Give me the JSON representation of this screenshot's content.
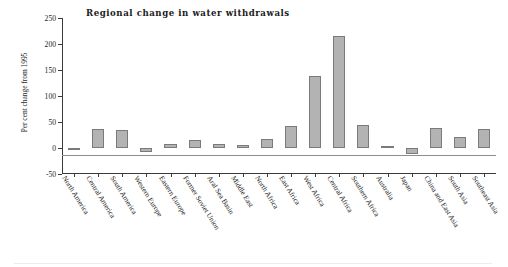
{
  "chart_data": {
    "type": "bar",
    "title": "Regional change in water withdrawals",
    "xlabel": "",
    "ylabel": "Per cent change from 1995",
    "ylim": [
      -50,
      250
    ],
    "yticks": [
      250,
      200,
      150,
      100,
      50,
      0,
      -50
    ],
    "grid": false,
    "legend": null,
    "bar_color": "#b3b3b3",
    "bar_edge_color": "#7a7a7a",
    "categories": [
      "North America",
      "Central America",
      "South America",
      "Western Europe",
      "Eastern Europe",
      "Former Soviet Union",
      "Aral Sea Basin",
      "Middle East",
      "North Africa",
      "East Africa",
      "West Africa",
      "Central Africa",
      "Southern Africa",
      "Australia",
      "Japan",
      "China and East Asia",
      "South Asia",
      "Southeast Asia"
    ],
    "values": [
      -1,
      37,
      35,
      -8,
      8,
      15,
      7,
      6,
      18,
      42,
      139,
      215,
      44,
      4,
      -11,
      39,
      21,
      37
    ]
  }
}
